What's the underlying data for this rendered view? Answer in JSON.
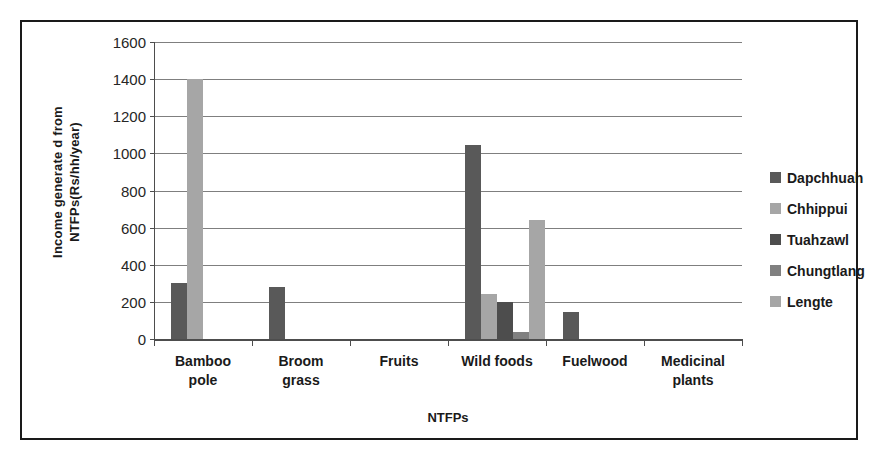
{
  "chart_data": {
    "type": "bar",
    "title": "",
    "xlabel": "NTFPs",
    "ylabel": "Income generate d from NTFPs(Rs/hh/year)",
    "ylabel_line1": "Income generate d from",
    "ylabel_line2": "NTFPs(Rs/hh/year)",
    "categories": [
      "Bamboo pole",
      "Broom grass",
      "Fruits",
      "Wild foods",
      "Fuelwood",
      "Medicinal plants"
    ],
    "category_lines": [
      [
        "Bamboo",
        "pole"
      ],
      [
        "Broom",
        "grass"
      ],
      [
        "Fruits"
      ],
      [
        "Wild foods"
      ],
      [
        "Fuelwood"
      ],
      [
        "Medicinal",
        "plants"
      ]
    ],
    "ylim": [
      0,
      1600
    ],
    "yticks": [
      0,
      200,
      400,
      600,
      800,
      1000,
      1200,
      1400,
      1600
    ],
    "ytick_labels": [
      "0",
      "200",
      "400",
      "600",
      "800",
      "1000",
      "1200",
      "1400",
      "1600"
    ],
    "grid": true,
    "legend_position": "right",
    "series": [
      {
        "name": "Dapchhuah",
        "color": "#595959",
        "values": [
          300,
          280,
          0,
          1045,
          145,
          0
        ]
      },
      {
        "name": "Chhippui",
        "color": "#a6a6a6",
        "values": [
          1400,
          0,
          0,
          240,
          0,
          0
        ]
      },
      {
        "name": "Tuahzawl",
        "color": "#4d4d4d",
        "values": [
          0,
          0,
          0,
          200,
          0,
          0
        ]
      },
      {
        "name": "Chungtlang",
        "color": "#808080",
        "values": [
          0,
          0,
          0,
          40,
          0,
          0
        ]
      },
      {
        "name": "Lengte",
        "color": "#a6a6a6",
        "values": [
          0,
          0,
          0,
          640,
          0,
          0
        ]
      }
    ]
  },
  "legend": {
    "items": [
      {
        "label": "Dapchhuah",
        "color": "#595959"
      },
      {
        "label": "Chhippui",
        "color": "#a6a6a6"
      },
      {
        "label": "Tuahzawl",
        "color": "#4d4d4d"
      },
      {
        "label": "Chungtlang",
        "color": "#808080"
      },
      {
        "label": "Lengte",
        "color": "#a6a6a6"
      }
    ]
  },
  "colors": {
    "frame": "#1a1a1a",
    "axis": "#4d4d4d",
    "gridline": "#7f7f7f",
    "text": "#1a1a1a",
    "background": "#ffffff"
  }
}
